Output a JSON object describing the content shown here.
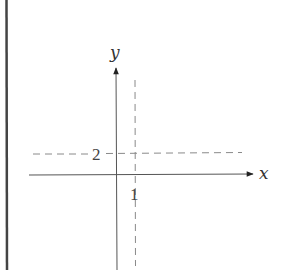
{
  "diagram": {
    "type": "coordinate-plane",
    "axes": {
      "x_label": "x",
      "y_label": "y"
    },
    "reference_lines": [
      {
        "orientation": "vertical",
        "value": 1,
        "style": "dashed",
        "label": "1"
      },
      {
        "orientation": "horizontal",
        "value": 2,
        "style": "dashed",
        "label": "2"
      }
    ],
    "colors": {
      "axis": "#555555",
      "dashed": "#888888",
      "border": "#444444",
      "text": "#333333"
    }
  }
}
